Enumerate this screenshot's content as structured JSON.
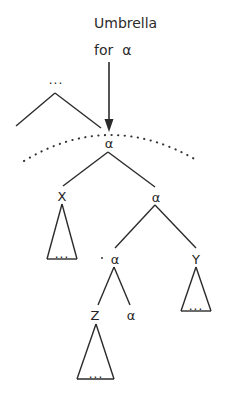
{
  "figure": {
    "type": "syntax-tree-diagram",
    "background_color": "#ffffff",
    "stroke_color": "#2b2b2b",
    "text_color": "#242424",
    "width": 233,
    "height": 403
  },
  "caption": {
    "line1": "Umbrella",
    "line2": "for",
    "line2_symbol": "α",
    "arrow_name": "down-arrow-pointer"
  },
  "ellipsis": {
    "text": "…",
    "dots": "..."
  },
  "nodes": {
    "top_context": {
      "label": "...",
      "name": "context-ellipsis-top"
    },
    "root_alpha": {
      "label": "α",
      "name": "node-alpha-root"
    },
    "left_child": {
      "label": "X",
      "name": "node-x"
    },
    "right_child": {
      "label": "α",
      "name": "node-alpha-second"
    },
    "inner_left_alpha": {
      "label": "α",
      "name": "node-alpha-third"
    },
    "inner_right_y": {
      "label": "Y",
      "name": "node-y"
    },
    "leaf_z": {
      "label": "Z",
      "name": "node-z"
    },
    "leaf_alpha": {
      "label": "α",
      "name": "node-alpha-leaf"
    }
  },
  "subtrees": [
    {
      "name": "subtree-x",
      "label": "..."
    },
    {
      "name": "subtree-y",
      "label": "..."
    },
    {
      "name": "subtree-z",
      "label": "..."
    }
  ],
  "annotations": {
    "umbrella_arc_name": "umbrella-dotted-arc",
    "umbrella_arc_style": "dotted"
  }
}
